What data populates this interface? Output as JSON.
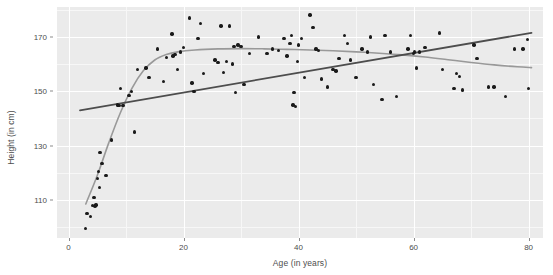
{
  "chart_data": {
    "type": "scatter",
    "title": "",
    "xlabel": "Age (in years)",
    "ylabel": "Height (in cm)",
    "xlim": [
      -2,
      82.5
    ],
    "ylim": [
      96,
      181
    ],
    "xticks": [
      0,
      20,
      40,
      60,
      80
    ],
    "xtick_labels": [
      "0",
      "20",
      "40",
      "60",
      "80"
    ],
    "yticks": [
      110,
      130,
      150,
      170
    ],
    "ytick_labels": [
      "110",
      "130",
      "150",
      "170"
    ],
    "x_minor_ticks": [
      10,
      30,
      50,
      70
    ],
    "y_minor_ticks": [
      100,
      120,
      140,
      160,
      180
    ],
    "grid": true,
    "legend": "none",
    "panel_background": "#ebebeb",
    "grid_color": "#ffffff",
    "point_color": "#1a1a1a",
    "point_size": 3.4,
    "series": [
      {
        "name": "observations",
        "marker": "filled-circle",
        "color": "#1a1a1a",
        "points": [
          [
            3.0,
            99.5
          ],
          [
            3.2,
            105.0
          ],
          [
            3.8,
            104.0
          ],
          [
            4.2,
            108.0
          ],
          [
            4.4,
            111.0
          ],
          [
            4.6,
            107.8
          ],
          [
            4.8,
            108.2
          ],
          [
            5.0,
            118.0
          ],
          [
            5.2,
            120.5
          ],
          [
            5.4,
            114.5
          ],
          [
            5.5,
            127.5
          ],
          [
            5.8,
            123.5
          ],
          [
            6.5,
            119.0
          ],
          [
            7.5,
            132.0
          ],
          [
            8.5,
            145.0
          ],
          [
            8.8,
            144.8
          ],
          [
            9.0,
            151.0
          ],
          [
            9.5,
            144.8
          ],
          [
            10.5,
            148.5
          ],
          [
            11.0,
            150.0
          ],
          [
            11.5,
            135.0
          ],
          [
            12.0,
            158.0
          ],
          [
            13.5,
            158.5
          ],
          [
            14.0,
            155.0
          ],
          [
            15.5,
            165.5
          ],
          [
            16.5,
            153.5
          ],
          [
            17.0,
            162.5
          ],
          [
            18.0,
            171.0
          ],
          [
            18.2,
            163.0
          ],
          [
            18.5,
            163.5
          ],
          [
            19.0,
            158.0
          ],
          [
            19.5,
            164.5
          ],
          [
            20.0,
            166.0
          ],
          [
            21.0,
            177.0
          ],
          [
            21.5,
            153.0
          ],
          [
            21.8,
            150.0
          ],
          [
            22.5,
            169.5
          ],
          [
            23.0,
            175.0
          ],
          [
            23.5,
            156.5
          ],
          [
            25.5,
            161.5
          ],
          [
            26.0,
            160.5
          ],
          [
            26.5,
            174.0
          ],
          [
            27.0,
            157.0
          ],
          [
            27.5,
            161.0
          ],
          [
            28.0,
            174.0
          ],
          [
            28.5,
            160.0
          ],
          [
            28.8,
            166.5
          ],
          [
            29.0,
            149.5
          ],
          [
            29.5,
            167.0
          ],
          [
            30.0,
            166.5
          ],
          [
            30.5,
            152.5
          ],
          [
            31.5,
            164.0
          ],
          [
            33.0,
            170.0
          ],
          [
            34.5,
            164.0
          ],
          [
            35.5,
            165.5
          ],
          [
            36.0,
            182.0
          ],
          [
            36.5,
            165.0
          ],
          [
            37.5,
            169.5
          ],
          [
            38.0,
            163.0
          ],
          [
            38.5,
            167.5
          ],
          [
            38.8,
            170.5
          ],
          [
            39.0,
            145.0
          ],
          [
            39.2,
            149.5
          ],
          [
            39.5,
            144.5
          ],
          [
            39.8,
            161.0
          ],
          [
            40.0,
            167.0
          ],
          [
            40.5,
            169.5
          ],
          [
            41.0,
            155.0
          ],
          [
            42.0,
            178.0
          ],
          [
            42.5,
            173.5
          ],
          [
            43.0,
            165.5
          ],
          [
            43.5,
            165.0
          ],
          [
            44.0,
            154.5
          ],
          [
            45.0,
            151.5
          ],
          [
            46.0,
            158.0
          ],
          [
            46.5,
            157.5
          ],
          [
            47.0,
            162.0
          ],
          [
            48.0,
            170.5
          ],
          [
            48.5,
            167.5
          ],
          [
            49.0,
            161.5
          ],
          [
            50.0,
            155.0
          ],
          [
            51.0,
            165.5
          ],
          [
            52.0,
            164.5
          ],
          [
            52.5,
            170.0
          ],
          [
            53.0,
            152.5
          ],
          [
            54.5,
            147.0
          ],
          [
            55.0,
            170.5
          ],
          [
            56.0,
            164.5
          ],
          [
            57.0,
            148.0
          ],
          [
            59.0,
            165.5
          ],
          [
            59.5,
            170.5
          ],
          [
            60.0,
            164.0
          ],
          [
            60.2,
            164.5
          ],
          [
            60.5,
            158.5
          ],
          [
            61.0,
            164.5
          ],
          [
            62.0,
            166.0
          ],
          [
            64.5,
            171.5
          ],
          [
            65.0,
            158.0
          ],
          [
            67.0,
            151.0
          ],
          [
            67.5,
            156.5
          ],
          [
            68.0,
            155.5
          ],
          [
            68.5,
            150.5
          ],
          [
            70.5,
            167.0
          ],
          [
            71.0,
            162.0
          ],
          [
            73.0,
            151.5
          ],
          [
            74.0,
            151.5
          ],
          [
            76.0,
            148.0
          ],
          [
            77.5,
            165.5
          ],
          [
            79.0,
            165.5
          ],
          [
            79.8,
            169.0
          ],
          [
            80.0,
            151.0
          ]
        ]
      }
    ],
    "fits": [
      {
        "name": "linear-regression",
        "type": "line",
        "color": "#4d4d4d",
        "width": 1.8,
        "points": [
          [
            2.0,
            143.0
          ],
          [
            80.5,
            171.5
          ]
        ]
      },
      {
        "name": "loess-smooth",
        "type": "curve",
        "color": "#999999",
        "width": 1.6,
        "points": [
          [
            3.0,
            108.5
          ],
          [
            5.0,
            119.0
          ],
          [
            7.0,
            131.0
          ],
          [
            9.0,
            142.0
          ],
          [
            11.0,
            151.0
          ],
          [
            13.0,
            157.5
          ],
          [
            15.0,
            161.5
          ],
          [
            17.0,
            163.5
          ],
          [
            19.0,
            164.5
          ],
          [
            22.0,
            165.2
          ],
          [
            26.0,
            165.6
          ],
          [
            30.0,
            165.7
          ],
          [
            34.0,
            165.6
          ],
          [
            38.0,
            165.4
          ],
          [
            42.0,
            165.2
          ],
          [
            46.0,
            164.9
          ],
          [
            50.0,
            164.5
          ],
          [
            54.0,
            164.0
          ],
          [
            58.0,
            163.4
          ],
          [
            62.0,
            162.6
          ],
          [
            66.0,
            161.6
          ],
          [
            70.0,
            160.6
          ],
          [
            74.0,
            159.7
          ],
          [
            78.0,
            159.0
          ],
          [
            80.5,
            158.7
          ]
        ]
      }
    ]
  }
}
